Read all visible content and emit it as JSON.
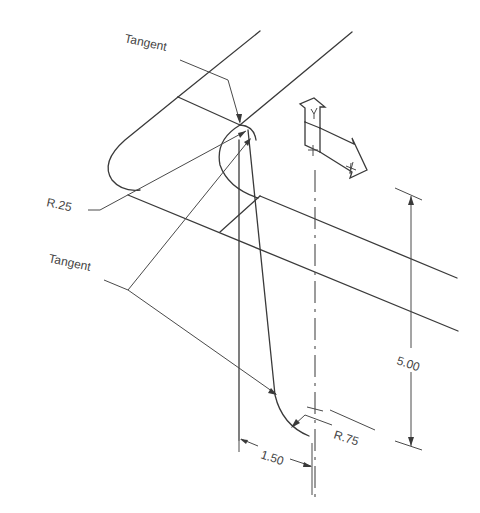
{
  "drawing": {
    "type": "isometric technical drawing",
    "labels": {
      "tangent_top": "Tangent",
      "tangent_left": "Tangent",
      "radius_small": "R.25",
      "radius_large": "R.75",
      "dim_horizontal": "1.50",
      "dim_vertical": "5.00"
    },
    "axis_indicator": {
      "y_label": "Y",
      "x_label": "X"
    },
    "colors": {
      "line": "#3a3a3a",
      "background": "#ffffff"
    }
  }
}
